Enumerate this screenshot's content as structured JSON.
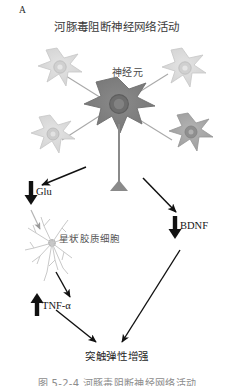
{
  "figure": {
    "panel_letter": "A",
    "title": "河豚毒阻断神经网络活动",
    "caption": "图 5-2-4  河豚毒阻断神经网络活动",
    "background_color": "#ffffff"
  },
  "labels": {
    "neuron": "神经元",
    "astrocyte": "星状胶质细胞",
    "outcome": "突触弹性增强"
  },
  "molecules": [
    {
      "name": "Glu",
      "label": "Glu",
      "direction": "down",
      "arrow_color": "#111111"
    },
    {
      "name": "BDNF",
      "label": "BDNF",
      "direction": "down",
      "arrow_color": "#111111"
    },
    {
      "name": "TNF-alpha",
      "label": "TNF-α",
      "direction": "up",
      "arrow_color": "#111111"
    }
  ],
  "colors": {
    "central_neuron_body": "#7e7e7e",
    "central_neuron_nucleus": "#6a6a6a",
    "peripheral_neuron_body": "#d9d9d9",
    "peripheral_neuron_dark": "#a6a6a6",
    "astrocyte": "#cfcfcf",
    "arrow_black": "#111111",
    "connector_gray": "#9a9a9a",
    "text_dark": "#1a1a1a",
    "text_gray": "#555555"
  },
  "diagram_flow": [
    {
      "from": "neuron-network",
      "to": "Glu",
      "type": "black-arrow"
    },
    {
      "from": "neuron-network",
      "to": "BDNF",
      "type": "black-arrow"
    },
    {
      "from": "Glu",
      "to": "astrocyte",
      "type": "gray-arrow"
    },
    {
      "from": "astrocyte",
      "to": "TNF-alpha",
      "type": "black-arrow"
    },
    {
      "from": "TNF-alpha",
      "to": "outcome",
      "type": "black-arrow"
    },
    {
      "from": "BDNF",
      "to": "outcome",
      "type": "black-arrow"
    }
  ]
}
